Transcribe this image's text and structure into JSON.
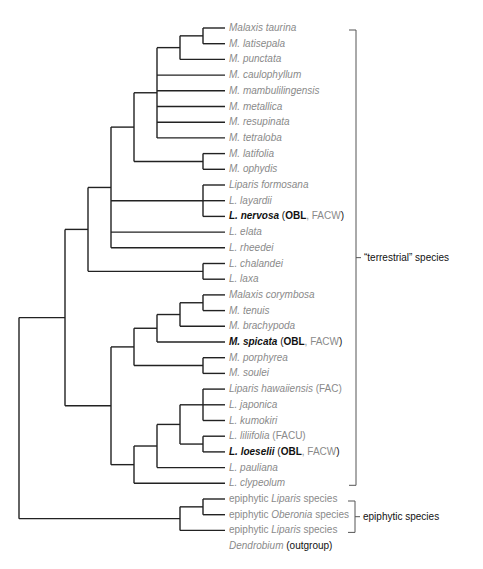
{
  "diagram": {
    "type": "phylogenetic-tree",
    "colors": {
      "branch": "#222222",
      "tip_text": "#8a8a8a",
      "emphasis_text": "#111111",
      "bracket": "#555555"
    },
    "tips": [
      {
        "id": "t0",
        "parts": [
          {
            "t": "Malaxis taurina",
            "i": true
          }
        ]
      },
      {
        "id": "t1",
        "parts": [
          {
            "t": "M. latisepala",
            "i": true
          }
        ]
      },
      {
        "id": "t2",
        "parts": [
          {
            "t": "M. punctata",
            "i": true
          }
        ]
      },
      {
        "id": "t3",
        "parts": [
          {
            "t": "M. caulophyllum",
            "i": true
          }
        ]
      },
      {
        "id": "t4",
        "parts": [
          {
            "t": "M. mambulilingensis",
            "i": true
          }
        ]
      },
      {
        "id": "t5",
        "parts": [
          {
            "t": "M. metallica",
            "i": true
          }
        ]
      },
      {
        "id": "t6",
        "parts": [
          {
            "t": "M. resupinata",
            "i": true
          }
        ]
      },
      {
        "id": "t7",
        "parts": [
          {
            "t": "M. tetraloba",
            "i": true
          }
        ]
      },
      {
        "id": "t8",
        "parts": [
          {
            "t": "M. latifolia",
            "i": true
          }
        ]
      },
      {
        "id": "t9",
        "parts": [
          {
            "t": "M. ophydis",
            "i": true
          }
        ]
      },
      {
        "id": "t10",
        "parts": [
          {
            "t": "Liparis formosana",
            "i": true
          }
        ]
      },
      {
        "id": "t11",
        "parts": [
          {
            "t": "L. layardii",
            "i": true
          }
        ]
      },
      {
        "id": "t12",
        "parts": [
          {
            "t": "L. nervosa",
            "i": true,
            "b": true
          },
          {
            "t": " (",
            "d": true
          },
          {
            "t": "OBL",
            "b": true
          },
          {
            "t": ", FACW",
            "d": false
          },
          {
            "t": ")",
            "d": true
          }
        ]
      },
      {
        "id": "t13",
        "parts": [
          {
            "t": "L. elata",
            "i": true
          }
        ]
      },
      {
        "id": "t14",
        "parts": [
          {
            "t": "L. rheedei",
            "i": true
          }
        ]
      },
      {
        "id": "t15",
        "parts": [
          {
            "t": "L. chalandei",
            "i": true
          }
        ]
      },
      {
        "id": "t16",
        "parts": [
          {
            "t": "L. laxa",
            "i": true
          }
        ]
      },
      {
        "id": "t17",
        "parts": [
          {
            "t": "Malaxis corymbosa",
            "i": true
          }
        ]
      },
      {
        "id": "t18",
        "parts": [
          {
            "t": "M. tenuis",
            "i": true
          }
        ]
      },
      {
        "id": "t19",
        "parts": [
          {
            "t": "M. brachypoda",
            "i": true
          }
        ]
      },
      {
        "id": "t20",
        "parts": [
          {
            "t": "M. spicata",
            "i": true,
            "b": true
          },
          {
            "t": " (",
            "d": true
          },
          {
            "t": "OBL",
            "b": true
          },
          {
            "t": ", FACW",
            "d": false
          },
          {
            "t": ")",
            "d": true
          }
        ]
      },
      {
        "id": "t21",
        "parts": [
          {
            "t": "M. porphyrea",
            "i": true
          }
        ]
      },
      {
        "id": "t22",
        "parts": [
          {
            "t": "M. soulei",
            "i": true
          }
        ]
      },
      {
        "id": "t23",
        "parts": [
          {
            "t": "Liparis hawaiiensis",
            "i": true
          },
          {
            "t": " (FAC)"
          }
        ]
      },
      {
        "id": "t24",
        "parts": [
          {
            "t": "L. japonica",
            "i": true
          }
        ]
      },
      {
        "id": "t25",
        "parts": [
          {
            "t": "L. kumokiri",
            "i": true
          }
        ]
      },
      {
        "id": "t26",
        "parts": [
          {
            "t": "L. liliifolia",
            "i": true
          },
          {
            "t": " (FACU)"
          }
        ]
      },
      {
        "id": "t27",
        "parts": [
          {
            "t": "L. loeselii",
            "i": true,
            "b": true
          },
          {
            "t": " (",
            "d": true
          },
          {
            "t": "OBL",
            "b": true
          },
          {
            "t": ", FACW",
            "d": false
          },
          {
            "t": ")",
            "d": true
          }
        ]
      },
      {
        "id": "t28",
        "parts": [
          {
            "t": "L. pauliana",
            "i": true
          }
        ]
      },
      {
        "id": "t29",
        "parts": [
          {
            "t": "L. clypeolum",
            "i": true
          }
        ]
      },
      {
        "id": "t30",
        "parts": [
          {
            "t": "epiphytic "
          },
          {
            "t": "Liparis",
            "i": true
          },
          {
            "t": " species"
          }
        ]
      },
      {
        "id": "t31",
        "parts": [
          {
            "t": "epiphytic "
          },
          {
            "t": "Oberonia",
            "i": true
          },
          {
            "t": " species"
          }
        ]
      },
      {
        "id": "t32",
        "parts": [
          {
            "t": "epiphytic "
          },
          {
            "t": "Liparis",
            "i": true
          },
          {
            "t": " species"
          }
        ]
      },
      {
        "id": "t33",
        "parts": [
          {
            "t": "Dendrobium",
            "i": true
          },
          {
            "t": " (outgroup)",
            "d": true
          }
        ]
      }
    ],
    "groups": [
      {
        "label": "“terrestrial” species",
        "from": 0,
        "to": 29
      },
      {
        "label": "epiphytic species",
        "from": 30,
        "to": 32
      }
    ],
    "newick": "((((((((t0,t1),t2),t3,t4,t5,t6,t7),(t8,t9)),(t10,t11,t12),t13,t14),(t15,t16)),(((((t17,t18),t19),t20),(t21,t22)),((((t23,t24,t25),(t26,t27)),t28),t29))),((t30,t31),t32)),t33)"
  }
}
